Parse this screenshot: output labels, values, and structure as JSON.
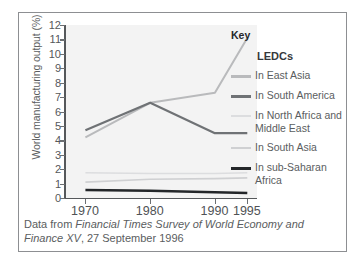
{
  "figure": {
    "border_color": "#8d8f92",
    "plot_background": "#f3f3f3"
  },
  "axes": {
    "ylabel": "World manufacturing output (%)",
    "yticks": [
      "12",
      "11",
      "10",
      "9",
      "8",
      "7",
      "6",
      "5",
      "4",
      "3",
      "2",
      "1",
      "0"
    ],
    "xticks": [
      "1970",
      "1980",
      "1990",
      "1995"
    ]
  },
  "legend": {
    "title": "Key",
    "group_label": "LEDCs",
    "entries": [
      {
        "label": "In East Asia",
        "color": "#b9babc",
        "width": "2.6px"
      },
      {
        "label": "In South America",
        "color": "#6f7275",
        "width": "3px"
      },
      {
        "label": "In North Africa and Middle East",
        "color": "#dcdddf",
        "width": "2.2px"
      },
      {
        "label": "In South Asia",
        "color": "#cfd0d2",
        "width": "2.2px"
      },
      {
        "label": "In sub-Saharan Africa",
        "color": "#232629",
        "width": "3.4px"
      }
    ]
  },
  "caption": {
    "prefix": "Data from ",
    "italic": "Financial Times Survey of World Economy and Finance XV",
    "suffix": ", 27 September 1996"
  },
  "chart_data": {
    "type": "line",
    "title": "",
    "xlabel": "",
    "ylabel": "World manufacturing output (%)",
    "x": [
      1970,
      1980,
      1990,
      1995
    ],
    "xlim": [
      1967,
      1996.5
    ],
    "ylim": [
      0,
      12
    ],
    "ytick_step": 1,
    "grid": false,
    "legend_position": "right",
    "series": [
      {
        "name": "In East Asia",
        "color": "#b9babc",
        "values": [
          4.2,
          6.6,
          7.3,
          11.1
        ]
      },
      {
        "name": "In South America",
        "color": "#6f7275",
        "values": [
          4.7,
          6.6,
          4.5,
          4.5
        ]
      },
      {
        "name": "In North Africa and Middle East",
        "color": "#dcdddf",
        "values": [
          1.75,
          1.7,
          1.7,
          1.75
        ]
      },
      {
        "name": "In South Asia",
        "color": "#cfd0d2",
        "values": [
          1.1,
          1.3,
          1.35,
          1.4
        ]
      },
      {
        "name": "In sub-Saharan Africa",
        "color": "#232629",
        "values": [
          0.55,
          0.5,
          0.4,
          0.35
        ]
      }
    ]
  }
}
